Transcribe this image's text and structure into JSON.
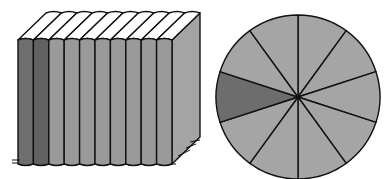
{
  "illustration": {
    "books": {
      "count": 10,
      "dark_count": 2,
      "colors": {
        "dark": "#6e6e6e",
        "darker": "#626262",
        "light": "#9a9a9a",
        "side": "#a4a4a4",
        "top": "#ffffff",
        "stroke": "#111111"
      }
    },
    "pie": {
      "slices": 10,
      "shaded_index": 7,
      "colors": {
        "slice": "#a5a5a5",
        "shaded": "#6d6d6d",
        "stroke": "#111111"
      }
    }
  }
}
